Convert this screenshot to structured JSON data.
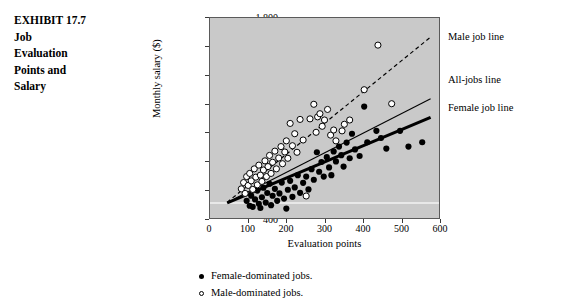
{
  "exhibit": {
    "lines": [
      "EXHIBIT 17.7",
      "Job",
      "Evaluation",
      "Points and",
      "Salary"
    ]
  },
  "annotations": {
    "male_line_label": "Male  job line",
    "alljobs_line_label": "All-jobs line",
    "female_line_label": "Female  job line"
  },
  "legend": {
    "female_label": "Female-dominated jobs.",
    "male_label": "Male-dominated jobs."
  },
  "colors": {
    "plot_background": "#c9c9c9",
    "axis": "#3a3a3a",
    "point_female": "#000000",
    "point_male": "#ffffff",
    "line_female": "#000000",
    "line_alljobs": "#000000",
    "line_male": "#000000",
    "baseline_rule": "#f2f2f2"
  },
  "chart_data": {
    "type": "scatter",
    "title": "Job Evaluation Points and Salary",
    "xlabel": "Evaluation points",
    "ylabel": "Monthly salary ($)",
    "xlim": [
      0,
      600
    ],
    "ylim": [
      400,
      1800
    ],
    "xticks": [
      0,
      100,
      200,
      300,
      400,
      500,
      600
    ],
    "yticks": [
      400,
      600,
      800,
      1000,
      1200,
      1400,
      1600,
      1800
    ],
    "ytick_labels": [
      "400",
      "600",
      "800",
      "1,000",
      "1,200",
      "1,400",
      "1,600",
      "1,800"
    ],
    "xtick_labels": [
      "0",
      "100",
      "200",
      "300",
      "400",
      "500",
      "600"
    ],
    "grid": false,
    "legend_position": "below-axis",
    "reference_rule_y": 505,
    "series": [
      {
        "name": "Female-dominated jobs.",
        "marker": "filled-circle",
        "points": [
          [
            96,
            520
          ],
          [
            104,
            486
          ],
          [
            108,
            556
          ],
          [
            112,
            478
          ],
          [
            118,
            530
          ],
          [
            124,
            592
          ],
          [
            128,
            500
          ],
          [
            132,
            470
          ],
          [
            136,
            545
          ],
          [
            140,
            612
          ],
          [
            146,
            508
          ],
          [
            150,
            575
          ],
          [
            156,
            640
          ],
          [
            160,
            490
          ],
          [
            164,
            556
          ],
          [
            170,
            604
          ],
          [
            176,
            520
          ],
          [
            182,
            572
          ],
          [
            188,
            648
          ],
          [
            194,
            536
          ],
          [
            200,
            466
          ],
          [
            204,
            598
          ],
          [
            210,
            660
          ],
          [
            216,
            548
          ],
          [
            222,
            614
          ],
          [
            230,
            700
          ],
          [
            236,
            576
          ],
          [
            244,
            646
          ],
          [
            252,
            690
          ],
          [
            258,
            600
          ],
          [
            266,
            742
          ],
          [
            272,
            668
          ],
          [
            280,
            860
          ],
          [
            286,
            724
          ],
          [
            292,
            792
          ],
          [
            298,
            690
          ],
          [
            306,
            826
          ],
          [
            312,
            754
          ],
          [
            318,
            700
          ],
          [
            324,
            866
          ],
          [
            330,
            796
          ],
          [
            338,
            900
          ],
          [
            344,
            840
          ],
          [
            350,
            760
          ],
          [
            358,
            928
          ],
          [
            366,
            818
          ],
          [
            372,
            990
          ],
          [
            380,
            880
          ],
          [
            392,
            834
          ],
          [
            404,
            1180
          ],
          [
            412,
            930
          ],
          [
            436,
            1010
          ],
          [
            448,
            960
          ],
          [
            462,
            886
          ],
          [
            498,
            1010
          ],
          [
            520,
            900
          ],
          [
            556,
            930
          ]
        ]
      },
      {
        "name": "Male-dominated jobs.",
        "marker": "open-circle",
        "points": [
          [
            82,
            604
          ],
          [
            88,
            648
          ],
          [
            92,
            572
          ],
          [
            96,
            690
          ],
          [
            100,
            628
          ],
          [
            104,
            712
          ],
          [
            108,
            660
          ],
          [
            112,
            600
          ],
          [
            116,
            744
          ],
          [
            120,
            686
          ],
          [
            124,
            632
          ],
          [
            128,
            770
          ],
          [
            132,
            700
          ],
          [
            136,
            656
          ],
          [
            140,
            736
          ],
          [
            144,
            800
          ],
          [
            148,
            690
          ],
          [
            152,
            760
          ],
          [
            156,
            838
          ],
          [
            160,
            712
          ],
          [
            164,
            790
          ],
          [
            170,
            868
          ],
          [
            174,
            744
          ],
          [
            180,
            820
          ],
          [
            186,
            900
          ],
          [
            190,
            780
          ],
          [
            196,
            862
          ],
          [
            200,
            940
          ],
          [
            204,
            818
          ],
          [
            210,
            1062
          ],
          [
            216,
            906
          ],
          [
            222,
            990
          ],
          [
            228,
            860
          ],
          [
            236,
            1090
          ],
          [
            244,
            946
          ],
          [
            252,
            554
          ],
          [
            262,
            1094
          ],
          [
            272,
            1196
          ],
          [
            278,
            1000
          ],
          [
            282,
            1108
          ],
          [
            288,
            1130
          ],
          [
            294,
            1042
          ],
          [
            300,
            1086
          ],
          [
            308,
            1160
          ],
          [
            316,
            980
          ],
          [
            324,
            1016
          ],
          [
            330,
            940
          ],
          [
            346,
            1010
          ],
          [
            352,
            1056
          ],
          [
            366,
            1086
          ],
          [
            404,
            1298
          ],
          [
            440,
            1610
          ],
          [
            476,
            1200
          ]
        ]
      }
    ],
    "trend_lines": [
      {
        "name": "Male  job line",
        "style": "dashed",
        "width": 1.2,
        "x0": 45,
        "y0": 510,
        "x1": 575,
        "y1": 1660
      },
      {
        "name": "All-jobs line",
        "style": "solid-thin",
        "width": 1.1,
        "x0": 45,
        "y0": 508,
        "x1": 578,
        "y1": 1235
      },
      {
        "name": "Female  job line",
        "style": "solid-thick",
        "width": 3.0,
        "x0": 45,
        "y0": 505,
        "x1": 578,
        "y1": 1105
      }
    ]
  }
}
